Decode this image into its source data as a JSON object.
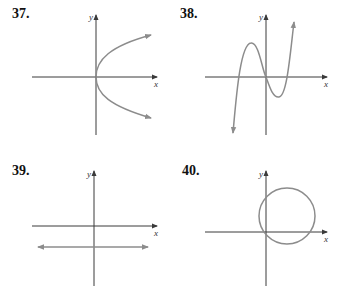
{
  "colors": {
    "axis": "#3a3a3a",
    "curve": "#8c8c8c",
    "label": "#111111",
    "background": "#ffffff"
  },
  "graphs": [
    {
      "number": "37.",
      "x_label": "x",
      "y_label": "y",
      "description": "Parabola opening to the right with vertex at the origin; arrows on both branches"
    },
    {
      "number": "38.",
      "x_label": "x",
      "y_label": "y",
      "description": "Cubic curve passing through origin with a local maximum left of the y-axis and a local minimum right of it; three x-intercepts; arrows at both ends"
    },
    {
      "number": "39.",
      "x_label": "x",
      "y_label": "y",
      "description": "Horizontal line below the x-axis with arrows at both ends"
    },
    {
      "number": "40.",
      "x_label": "x",
      "y_label": "y",
      "description": "Circle centered in the first quadrant passing through the origin"
    }
  ]
}
